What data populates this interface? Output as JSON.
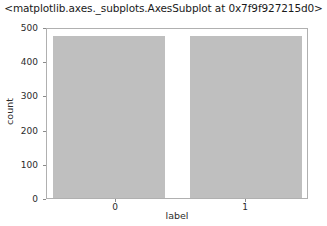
{
  "chart_data": {
    "type": "bar",
    "title": "<matplotlib.axes._subplots.AxesSubplot at 0x7f9f927215d0>",
    "xlabel": "label",
    "ylabel": "count",
    "categories": [
      "0",
      "1"
    ],
    "values": [
      480,
      480
    ],
    "series": [
      {
        "name": "count",
        "values": [
          480,
          480
        ]
      }
    ],
    "ylim": [
      0,
      500
    ],
    "yticks": [
      0,
      100,
      200,
      300,
      400,
      500
    ],
    "ytick_labels": [
      "0",
      "100",
      "200",
      "300",
      "400",
      "500"
    ],
    "xticks": [
      0,
      1
    ],
    "xtick_labels": [
      "0",
      "1"
    ],
    "grid": false,
    "legend": null,
    "bar_color": "#bfbfbf",
    "axes_edge_color": "#b0b0b0",
    "background_color": "#ffffff"
  }
}
